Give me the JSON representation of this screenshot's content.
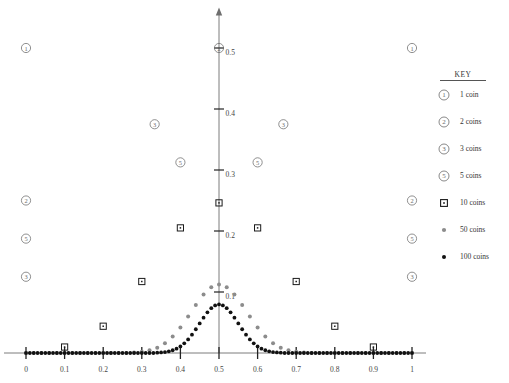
{
  "chart_data": {
    "type": "scatter",
    "title": "",
    "xlabel": "",
    "ylabel": "",
    "xlim": [
      0,
      1
    ],
    "ylim": [
      0,
      0.56
    ],
    "grid": false,
    "legend_position": "right",
    "xticks": [
      "0",
      "0.1",
      "0.2",
      "0.3",
      "0.4",
      "0.5",
      "0.6",
      "0.7",
      "0.8",
      "0.9",
      "1"
    ],
    "xtick_values": [
      0,
      0.1,
      0.2,
      0.3,
      0.4,
      0.5,
      0.6,
      0.7,
      0.8,
      0.9,
      1
    ],
    "yticks": [
      "0.1",
      "0.2",
      "0.3",
      "0.4",
      "0.5"
    ],
    "ytick_values": [
      0.1,
      0.2,
      0.3,
      0.4,
      0.5
    ],
    "series": [
      {
        "name": "1 coin",
        "marker": "circled-1",
        "color": "#6b6b6b",
        "points": [
          [
            0,
            0.5
          ],
          [
            1,
            0.5
          ]
        ]
      },
      {
        "name": "2 coins",
        "marker": "circled-2",
        "color": "#6b6b6b",
        "points": [
          [
            0,
            0.25
          ],
          [
            0.5,
            0.5
          ],
          [
            1,
            0.25
          ]
        ]
      },
      {
        "name": "3 coins",
        "marker": "circled-3",
        "color": "#6b6b6b",
        "points": [
          [
            0,
            0.125
          ],
          [
            0.3333,
            0.375
          ],
          [
            0.6667,
            0.375
          ],
          [
            1,
            0.125
          ]
        ]
      },
      {
        "name": "5 coins",
        "marker": "circled-5",
        "color": "#6b6b6b",
        "points": [
          [
            0,
            0.1875
          ],
          [
            0.4,
            0.3125
          ],
          [
            0.6,
            0.3125
          ],
          [
            1,
            0.1875
          ]
        ]
      },
      {
        "name": "10 coins",
        "marker": "open-square",
        "color": "#1a1a1a",
        "points": [
          [
            0.1,
            0.0098
          ],
          [
            0.2,
            0.0439
          ],
          [
            0.3,
            0.1172
          ],
          [
            0.4,
            0.2051
          ],
          [
            0.5,
            0.2461
          ],
          [
            0.6,
            0.2051
          ],
          [
            0.7,
            0.1172
          ],
          [
            0.8,
            0.0439
          ],
          [
            0.9,
            0.0098
          ]
        ]
      },
      {
        "name": "50 coins",
        "marker": "gray-dot",
        "color": "#8c8c8c",
        "points": [
          [
            0.26,
            0.0011
          ],
          [
            0.28,
            0.0028
          ],
          [
            0.3,
            0.0065
          ],
          [
            0.32,
            0.0139
          ],
          [
            0.34,
            0.027
          ],
          [
            0.36,
            0.0478
          ],
          [
            0.38,
            0.0762
          ],
          [
            0.4,
            0.1097
          ],
          [
            0.42,
            0.1425
          ],
          [
            0.44,
            0.1683
          ],
          [
            0.46,
            0.1811
          ],
          [
            0.48,
            0.1123
          ],
          [
            0.5,
            0.1123
          ],
          [
            0.52,
            0.1123
          ],
          [
            0.54,
            0.1683
          ],
          [
            0.56,
            0.1425
          ],
          [
            0.58,
            0.1097
          ],
          [
            0.6,
            0.0762
          ],
          [
            0.62,
            0.0478
          ],
          [
            0.64,
            0.027
          ],
          [
            0.66,
            0.0139
          ],
          [
            0.68,
            0.0065
          ],
          [
            0.7,
            0.0028
          ],
          [
            0.72,
            0.0011
          ]
        ]
      },
      {
        "name": "100 coins",
        "marker": "black-dot",
        "color": "#111111",
        "points": [
          [
            0.35,
            0.0009
          ],
          [
            0.38,
            0.0108
          ],
          [
            0.4,
            0.0159
          ],
          [
            0.42,
            0.0398
          ],
          [
            0.44,
            0.0666
          ],
          [
            0.46,
            0.0819
          ],
          [
            0.48,
            0.0735
          ],
          [
            0.5,
            0.0796
          ],
          [
            0.52,
            0.0735
          ],
          [
            0.54,
            0.0666
          ],
          [
            0.56,
            0.0398
          ],
          [
            0.58,
            0.0159
          ],
          [
            0.6,
            0.0108
          ],
          [
            0.65,
            0.0009
          ]
        ]
      }
    ],
    "peak_values": {
      "50_coins_peak": 0.1123,
      "100_coins_peak": 0.0796,
      "10_coins_peak": 0.2461
    }
  },
  "key": {
    "title": "KEY",
    "entries": [
      {
        "symbol": "circled-1",
        "label": "1 coin"
      },
      {
        "symbol": "circled-2",
        "label": "2 coins"
      },
      {
        "symbol": "circled-3",
        "label": "3 coins"
      },
      {
        "symbol": "circled-5",
        "label": "5 coins"
      },
      {
        "symbol": "open-square",
        "label": "10 coins"
      },
      {
        "symbol": "gray-dot",
        "label": "50 coins"
      },
      {
        "symbol": "black-dot",
        "label": "100 coins"
      }
    ]
  },
  "colors": {
    "axis": "#6e6e6e",
    "tick_text": "#444444",
    "marker_outline": "#6b6b6b",
    "square": "#1a1a1a",
    "gray_dot": "#8c8c8c",
    "black_dot": "#111111",
    "background": "#ffffff"
  }
}
